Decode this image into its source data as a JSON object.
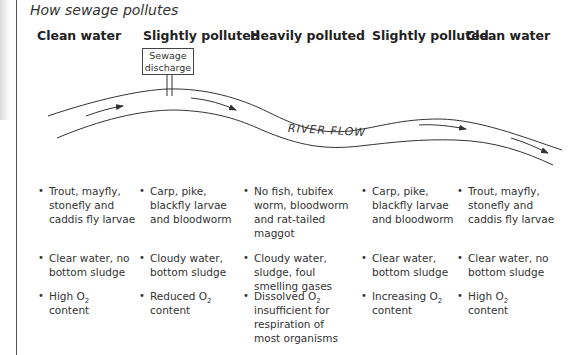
{
  "title": "How sewage pollutes",
  "zones": [
    {
      "heading": "Clean water",
      "x": 37
    },
    {
      "heading": "Slightly polluted",
      "x": 143
    },
    {
      "heading": "Heavily polluted",
      "x": 250
    },
    {
      "heading": "Slightly polluted",
      "x": 372
    },
    {
      "heading": "Clean water",
      "x": 466
    }
  ],
  "sewage_box": {
    "line1": "Sewage",
    "line2": "discharge"
  },
  "river_label": "RIVER FLOW",
  "rows": {
    "organisms": [
      "Trout, mayfly, stonefly and caddis fly larvae",
      "Carp, pike, blackfly larvae and bloodworm",
      "No fish, tubifex worm, bloodworm and rat-tailed maggot",
      "Carp, pike, blackfly larvae and bloodworm",
      "Trout, mayfly, stonefly and caddis fly larvae"
    ],
    "water": [
      "Clear water, no bottom sludge",
      "Cloudy water, bottom sludge",
      "Cloudy water, sludge, foul smelling gases",
      "Clear water, bottom sludge",
      "Clear water, no bottom sludge"
    ],
    "oxygen": [
      {
        "pre": "High O",
        "sub": "2",
        "post": " content"
      },
      {
        "pre": "Reduced O",
        "sub": "2",
        "post": " content"
      },
      {
        "pre": "Dissolved O",
        "sub": "2",
        "post": " insufficient for respiration of most organisms"
      },
      {
        "pre": "Increasing O",
        "sub": "2",
        "post": " content"
      },
      {
        "pre": "High O",
        "sub": "2",
        "post": " content"
      }
    ]
  },
  "organism_lines": [
    [
      "Trout, mayfly,",
      "stonefly and",
      "caddis fly larvae"
    ],
    [
      "Carp, pike,",
      "blackfly larvae",
      "and bloodworm"
    ],
    [
      "No fish, tubifex",
      "worm, bloodworm",
      "and rat-tailed",
      "maggot"
    ],
    [
      "Carp, pike,",
      "blackfly larvae",
      "and bloodworm"
    ],
    [
      "Trout, mayfly,",
      "stonefly and",
      "caddis fly larvae"
    ]
  ],
  "water_lines": [
    [
      "Clear water, no",
      "bottom sludge"
    ],
    [
      "Cloudy water,",
      "bottom sludge"
    ],
    [
      "Cloudy water,",
      "sludge, foul",
      "smelling gases"
    ],
    [
      "Clear water,",
      "bottom sludge"
    ],
    [
      "Clear water, no",
      "bottom sludge"
    ]
  ],
  "oxygen_lines": [
    [
      "content"
    ],
    [
      "content"
    ],
    [
      "insufficient for",
      "respiration of",
      "most organisms"
    ],
    [
      "content"
    ],
    [
      "content"
    ]
  ],
  "colors": {
    "line": "#333333",
    "text": "#231f20"
  }
}
